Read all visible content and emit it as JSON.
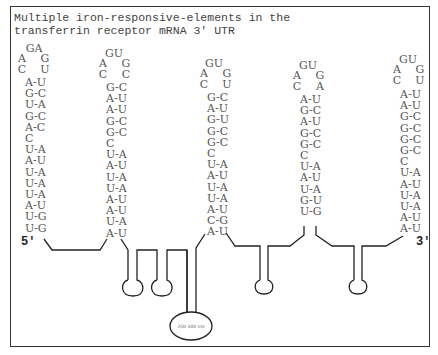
{
  "title": {
    "line1": "Multiple iron-responsive-elements in the",
    "line2": "transferrin receptor mRNA 3' UTR"
  },
  "ends": {
    "five_prime": "5'",
    "three_prime": "3'"
  },
  "insert_label": "250-300 nts",
  "stems": [
    {
      "id": "ire-1",
      "loop_top": "GA",
      "loop_sides": [
        [
          "A",
          "G"
        ],
        [
          "C",
          "U"
        ]
      ],
      "pairs": [
        "A-U",
        "G-C",
        "U-A",
        "G-C",
        "A-C",
        "C",
        "U-A",
        "A-U",
        "U-A",
        "U-A",
        "U-A",
        "A-U",
        "U-G",
        "U-G"
      ]
    },
    {
      "id": "ire-2",
      "loop_top": "GU",
      "loop_sides": [
        [
          "A",
          "G"
        ],
        [
          "C",
          "C"
        ]
      ],
      "pairs": [
        "G-C",
        "A-U",
        "A-U",
        "G-C",
        "G-C",
        "C",
        "U-A",
        "A-U",
        "U-A",
        "U-A",
        "A-U",
        "A-U",
        "U-A",
        "A-U"
      ]
    },
    {
      "id": "ire-3",
      "loop_top": "GU",
      "loop_sides": [
        [
          "A",
          "G"
        ],
        [
          "C",
          "U"
        ]
      ],
      "pairs": [
        "G-C",
        "A-U",
        "G-U",
        "G-C",
        "G-C",
        "C",
        "U-A",
        "A-U",
        "U-A",
        "U-A",
        "A-U",
        "C-G",
        "A-U"
      ]
    },
    {
      "id": "ire-4",
      "loop_top": "GU",
      "loop_sides": [
        [
          "A",
          "G"
        ],
        [
          "C",
          "A"
        ]
      ],
      "pairs": [
        "A-U",
        "G-C",
        "A-U",
        "G-C",
        "G-C",
        "C",
        "U-A",
        "A-U",
        "U-A",
        "G-U",
        "U-G"
      ]
    },
    {
      "id": "ire-5",
      "loop_top": "GU",
      "loop_sides": [
        [
          "A",
          "G"
        ],
        [
          "C",
          "U"
        ]
      ],
      "pairs": [
        "A-U",
        "A-U",
        "G-C",
        "G-C",
        "G-C",
        "G-C",
        "C",
        "U-A",
        "A-U",
        "U-A",
        "U-A",
        "A-U",
        "A-U"
      ]
    }
  ],
  "colors": {
    "line": "#222222",
    "text": "#555555",
    "frame": "#333333"
  }
}
